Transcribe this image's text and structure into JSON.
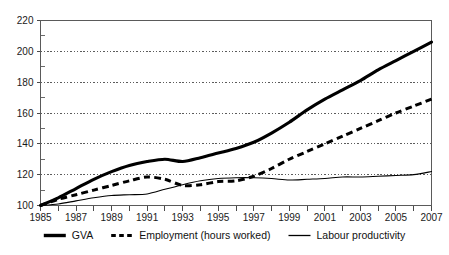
{
  "chart_data": {
    "type": "line",
    "title": "",
    "subtitle": "",
    "xlabel": "",
    "ylabel": "",
    "xlim": [
      1985,
      2007
    ],
    "ylim": [
      100,
      220
    ],
    "grid": true,
    "legend_position": "bottom",
    "y_ticks": [
      100,
      120,
      140,
      160,
      180,
      200,
      220
    ],
    "y_tick_labels": [
      "100",
      "120",
      "140",
      "160",
      "180",
      "200",
      "220"
    ],
    "y_minor_ticks": [
      110,
      130,
      150,
      170,
      190,
      210
    ],
    "x_ticks": [
      1985,
      1986,
      1987,
      1988,
      1989,
      1990,
      1991,
      1992,
      1993,
      1994,
      1995,
      1996,
      1997,
      1998,
      1999,
      2000,
      2001,
      2002,
      2003,
      2004,
      2005,
      2006,
      2007
    ],
    "x_tick_labels": [
      "1985",
      "",
      "1987",
      "",
      "1989",
      "",
      "1991",
      "",
      "1993",
      "",
      "1995",
      "",
      "1997",
      "",
      "1999",
      "",
      "2001",
      "",
      "2003",
      "",
      "2005",
      "",
      "2007"
    ],
    "x": [
      1985,
      1986,
      1987,
      1988,
      1989,
      1990,
      1991,
      1992,
      1993,
      1994,
      1995,
      1996,
      1997,
      1998,
      1999,
      2000,
      2001,
      2002,
      2003,
      2004,
      2005,
      2006,
      2007
    ],
    "series": [
      {
        "name": "GVA",
        "style": "thick-solid",
        "color": "#000000",
        "values": [
          100,
          105,
          111,
          117,
          122,
          126,
          128.5,
          130,
          128.5,
          131,
          134,
          137,
          141,
          147,
          154,
          162,
          169,
          175,
          181,
          188,
          194,
          200,
          206
        ]
      },
      {
        "name": "Employment (hours worked)",
        "style": "dashed",
        "color": "#000000",
        "values": [
          100,
          104,
          107,
          110,
          113,
          116,
          118.5,
          117,
          113,
          113.5,
          115.5,
          116,
          119,
          124,
          130,
          135,
          140,
          145,
          150,
          155,
          160,
          164.5,
          169
        ]
      },
      {
        "name": "Labour productivity",
        "style": "thin-solid",
        "color": "#000000",
        "values": [
          100,
          101,
          103,
          105,
          106.5,
          107,
          107.5,
          110.5,
          113.5,
          116,
          117.5,
          118,
          118,
          117.5,
          116.5,
          117,
          117.5,
          118.5,
          118.5,
          119,
          119.5,
          120,
          122
        ]
      }
    ]
  },
  "legend": {
    "entries": [
      {
        "label": "GVA",
        "style": "thick-solid"
      },
      {
        "label": "Employment (hours worked)",
        "style": "dashed"
      },
      {
        "label": "Labour productivity",
        "style": "thin-solid"
      }
    ]
  }
}
